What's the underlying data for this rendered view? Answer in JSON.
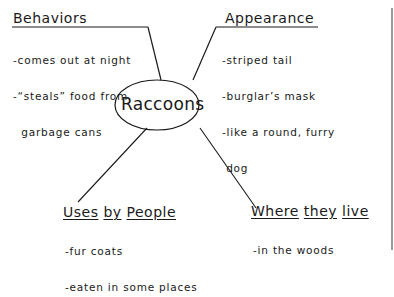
{
  "center": {
    "label": "Raccoons"
  },
  "branches": [
    {
      "title": "Behaviors",
      "items": [
        "-comes out at night",
        "-“steals” food from",
        "  garbage cans"
      ]
    },
    {
      "title": "Appearance",
      "items": [
        "-striped tail",
        "-burglar’s mask",
        "-like a round, furry",
        " dog"
      ]
    },
    {
      "title_parts": [
        "Uses",
        "by",
        "People"
      ],
      "items": [
        "-fur coats",
        "-eaten in some places"
      ]
    },
    {
      "title_parts": [
        "Where",
        "they",
        "live"
      ],
      "items": [
        "-in the woods"
      ]
    }
  ],
  "colors": {
    "ink": "#1a1a1a",
    "paper": "#ffffff",
    "edge": "#777777"
  }
}
